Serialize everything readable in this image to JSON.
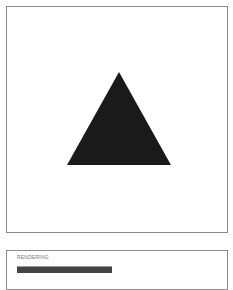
{
  "canvas": {
    "shape": {
      "type": "triangle",
      "points": [
        [
          119,
          72
        ],
        [
          67,
          165
        ],
        [
          171,
          165
        ]
      ],
      "fill": "#1a1a1a"
    },
    "border_color": "#8a8a8a"
  },
  "info_panel": {
    "label": "RENDERING",
    "bar_color": "#444444"
  }
}
